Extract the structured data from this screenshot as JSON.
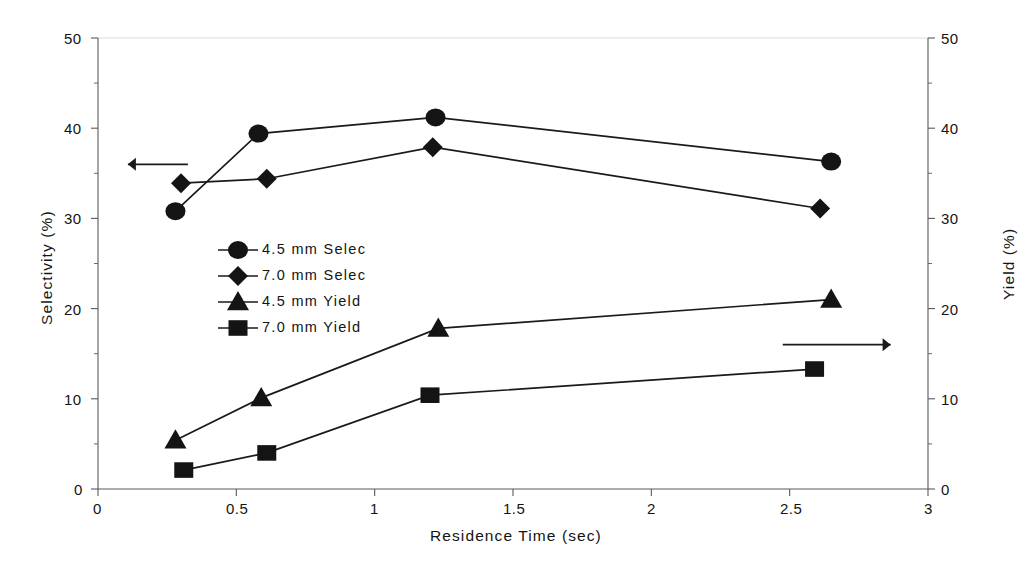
{
  "chart_data": {
    "type": "line",
    "title": "",
    "xlabel": "Residence Time (sec)",
    "ylabel": "Selectivity (%)",
    "y2label": "Yield (%)",
    "xlim": [
      0,
      3
    ],
    "ylim": [
      0,
      50
    ],
    "y2lim": [
      0,
      50
    ],
    "grid": false,
    "legend_position": "center-left-inside",
    "x_ticks": [
      "0",
      "0.5",
      "1",
      "1.5",
      "2",
      "2.5",
      "3"
    ],
    "x_tick_values": [
      0,
      0.5,
      1,
      1.5,
      2,
      2.5,
      3
    ],
    "y_ticks": [
      "0",
      "10",
      "20",
      "30",
      "40",
      "50"
    ],
    "y_tick_values": [
      0,
      10,
      20,
      30,
      40,
      50
    ],
    "y_minor_tick_values": [
      5,
      15,
      25,
      35,
      45
    ],
    "y2_ticks": [
      "0",
      "10",
      "20",
      "30",
      "40",
      "50"
    ],
    "y2_tick_values": [
      0,
      10,
      20,
      30,
      40,
      50
    ],
    "y2_minor_tick_values": [
      5,
      15,
      25,
      35,
      45
    ],
    "series": [
      {
        "name": "4.5 mm Selec",
        "marker": "circle",
        "axis": "left",
        "x": [
          0.28,
          0.58,
          1.22,
          2.65
        ],
        "values": [
          30.8,
          39.4,
          41.2,
          36.3
        ]
      },
      {
        "name": "7.0 mm Selec",
        "marker": "diamond",
        "axis": "left",
        "x": [
          0.3,
          0.61,
          1.21,
          2.61
        ],
        "values": [
          33.9,
          34.4,
          37.9,
          31.1
        ]
      },
      {
        "name": "4.5 mm Yield",
        "marker": "triangle",
        "axis": "right",
        "x": [
          0.28,
          0.59,
          1.23,
          2.65
        ],
        "values": [
          5.4,
          10.1,
          17.8,
          21.0
        ]
      },
      {
        "name": "7.0 mm Yield",
        "marker": "square",
        "axis": "right",
        "x": [
          0.31,
          0.61,
          1.2,
          2.59
        ],
        "values": [
          2.1,
          4.0,
          10.4,
          13.3
        ]
      }
    ],
    "annotations": [
      {
        "name": "left-axis-arrow",
        "direction": "left",
        "x_start": 0.325,
        "x_end": 0.108,
        "y": 36.0
      },
      {
        "name": "right-axis-arrow",
        "direction": "right",
        "x_start": 2.475,
        "x_end": 2.865,
        "y": 16.0
      }
    ],
    "colors": {
      "line": "#1a1a1a",
      "marker": "#141414",
      "axis": "#5a5a5a",
      "background": "#ffffff"
    }
  }
}
